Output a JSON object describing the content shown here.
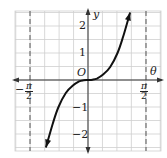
{
  "chart_data": {
    "type": "line",
    "title": "",
    "xlabel": "θ",
    "ylabel": "y",
    "origin_label": "O",
    "x_range": [
      -1.8,
      2.1
    ],
    "y_range": [
      -2.5,
      2.5
    ],
    "grid": true,
    "asymptotes": [
      {
        "x_label": "−π/2",
        "value": -1.5708,
        "style": "dashed"
      },
      {
        "x_label": "π/2",
        "value": 1.5708,
        "style": "dashed"
      }
    ],
    "y_ticks": [
      {
        "value": 2,
        "label": "2"
      },
      {
        "value": 1,
        "label": "1"
      },
      {
        "value": -1,
        "label": "−1"
      },
      {
        "value": -2,
        "label": "−2"
      }
    ],
    "x_tick_labels": [
      {
        "value": -1.5708,
        "num": "π",
        "den": "2",
        "sign": "−"
      },
      {
        "value": 1.5708,
        "num": "π",
        "den": "2",
        "sign": ""
      }
    ],
    "series": [
      {
        "name": "curve",
        "x": [
          -1.14,
          -0.95,
          -0.8,
          -0.6,
          -0.41,
          -0.24,
          -0.12,
          0,
          0.12,
          0.24,
          0.41,
          0.6,
          0.8,
          0.95,
          1.14
        ],
        "y": [
          -2.5,
          -1.6,
          -1.0,
          -0.48,
          -0.2,
          -0.05,
          -0.01,
          0,
          0.01,
          0.05,
          0.2,
          0.48,
          1.0,
          1.6,
          2.5
        ],
        "arrows": "both"
      }
    ]
  }
}
